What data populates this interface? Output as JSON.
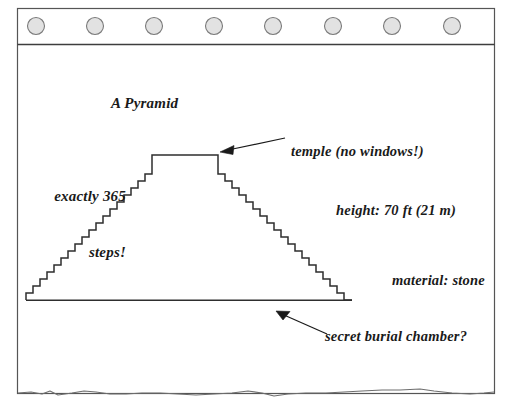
{
  "diagram": {
    "title": "A Pyramid",
    "annotations": {
      "steps_line1": "exactly 365",
      "steps_line2": "steps!",
      "temple": "temple (no windows!)",
      "height": "height: 70 ft (21 m)",
      "material": "material: stone",
      "chamber": "secret burial chamber?"
    },
    "colors": {
      "ink": "#1a1a1a",
      "frame_stroke": "#555555",
      "circle_fill": "#e2e2e2",
      "circle_stroke": "#7a7a7a",
      "paper": "#ffffff"
    },
    "header": {
      "circle_count": 8,
      "circle_diameter_px": 17
    },
    "structure": {
      "step_count_per_side": 18,
      "base_left_x": 26,
      "base_right_x": 352,
      "base_y": 300,
      "temple_left_x": 152,
      "temple_right_x": 218,
      "temple_top_y": 155
    }
  }
}
